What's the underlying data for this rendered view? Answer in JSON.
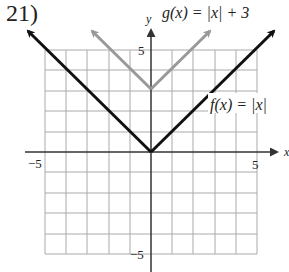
{
  "problem_number": "21)",
  "graph": {
    "x_axis_label": "x",
    "y_axis_label": "y",
    "x_min_label": "−5",
    "x_max_label": "5",
    "y_max_label": "5",
    "y_min_label": "−5",
    "range": {
      "xmin": -5,
      "xmax": 5,
      "ymin": -5,
      "ymax": 5
    }
  },
  "functions": [
    {
      "label": "f(x) = |x|",
      "expression": "|x|",
      "color": "#111111"
    },
    {
      "label": "g(x) = |x| + 3",
      "expression": "|x| + 3",
      "color": "#999999"
    }
  ]
}
